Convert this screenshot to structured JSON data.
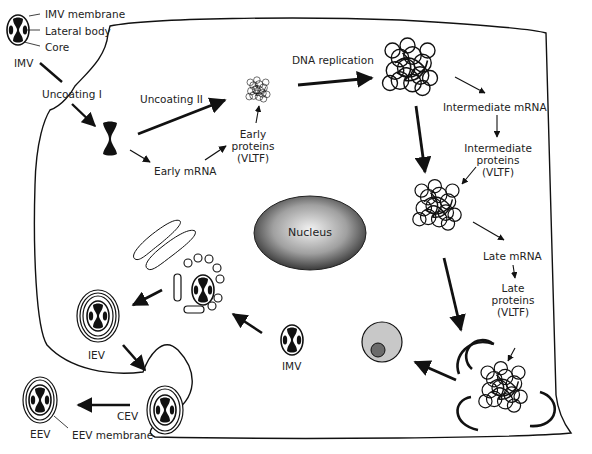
{
  "legend": {
    "membrane": "IMV membrane",
    "lateral_body": "Lateral body",
    "core": "Core",
    "imv": "IMV"
  },
  "steps": {
    "uncoating1": "Uncoating I",
    "uncoating2": "Uncoating II",
    "early_mrna": "Early mRNA",
    "early_proteins": [
      "Early",
      "proteins",
      "(VLTF)"
    ],
    "dna_replication": "DNA replication",
    "intermediate_mrna": "Intermediate mRNA",
    "intermediate_proteins": [
      "Intermediate",
      "proteins",
      "(VLTF)"
    ],
    "late_mrna": "Late mRNA",
    "late_proteins": [
      "Late",
      "proteins",
      "(VLTF)"
    ]
  },
  "nucleus": "Nucleus",
  "particles": {
    "imv": "IMV",
    "iev": "IEV",
    "cev": "CEV",
    "eev": "EEV",
    "eev_membrane": "EEV membrane"
  },
  "colors": {
    "ink": "#111111",
    "nucleus_center": "#f2f2f2",
    "nucleus_edge": "#3a3a3a",
    "factory_outer": "#c8c8c8",
    "factory_inner": "#6b6b6b"
  }
}
